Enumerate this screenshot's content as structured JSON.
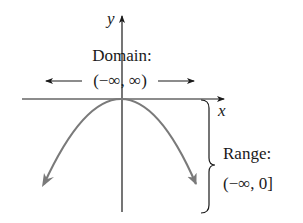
{
  "diagram": {
    "axes": {
      "x_label": "x",
      "y_label": "y"
    },
    "domain": {
      "title": "Domain:",
      "interval": "(−∞, ∞)"
    },
    "range": {
      "title": "Range:",
      "interval": "(−∞, 0]"
    },
    "curve": {
      "description": "downward-opening parabola with vertex at origin",
      "color": "#7a7a7a"
    },
    "colors": {
      "axis": "#1a1a1a",
      "curve": "#7a7a7a",
      "text": "#1a1a1a",
      "background": "#ffffff"
    }
  }
}
